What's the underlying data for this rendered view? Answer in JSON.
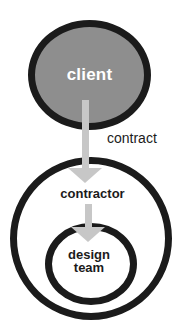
{
  "diagram": {
    "nodes": {
      "client": {
        "label": "client"
      },
      "contractor": {
        "label": "contractor"
      },
      "design_team": {
        "label": "design team"
      }
    },
    "edges": {
      "client_to_contractor": {
        "label": "contract",
        "icon": "down-arrow-icon"
      },
      "contractor_to_design_team": {
        "label": "",
        "icon": "down-arrow-icon"
      }
    },
    "colors": {
      "client_fill": "#8e8e8e",
      "outline": "#1b1b1b",
      "arrow": "#c7c7c7",
      "client_label": "#ffffff",
      "text": "#1b1b1b",
      "background": "#ffffff"
    }
  }
}
